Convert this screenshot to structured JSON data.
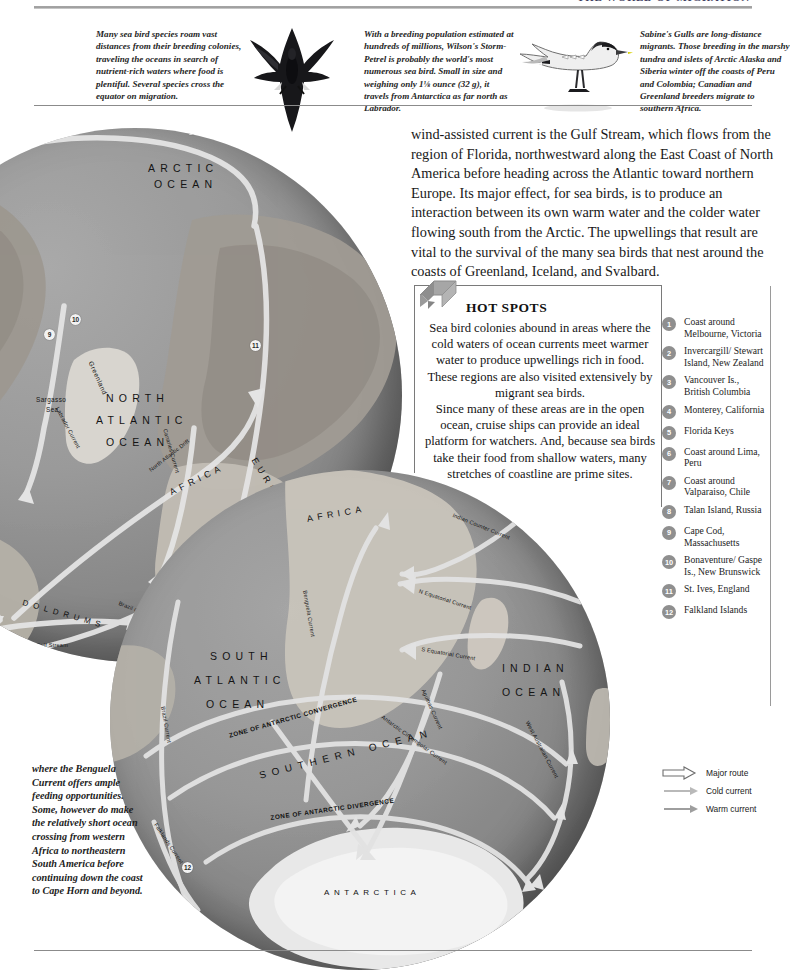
{
  "header": {
    "title": "THE WORLD OF MIGRATION"
  },
  "captions": [
    {
      "id": "cap-1",
      "text": "Many sea bird species roam vast distances from their breeding colonies, traveling the oceans in search of nutrient-rich waters where food is plentiful. Several species cross the equator on migration."
    },
    {
      "id": "cap-2",
      "text": "With a breeding population estimated at hundreds of millions, Wilson's Storm-Petrel is probably the world's most numerous sea bird. Small in size and weighing only 1⅛ ounce (32 g), it travels from Antarctica as far north as Labrador."
    },
    {
      "id": "cap-3",
      "text": "Sabine's Gulls are long-distance migrants. Those breeding in the marshy tundra and islets of Arctic Alaska and Siberia winter off the coasts of Peru and Colombia; Canadian and Greenland breeders migrate to southern Africa."
    }
  ],
  "birds": [
    {
      "name": "wilsons-storm-petrel",
      "label": "Wilson's Storm-Petrel"
    },
    {
      "name": "sabines-gull",
      "label": "Sabine's Gull"
    }
  ],
  "body_copy": "wind-assisted current is the Gulf Stream, which flows from the region of Florida, northwestward along the East Coast of North America before heading across the Atlantic toward northern Europe. Its major effect, for sea birds, is to produce an interaction between its own warm water and the colder water flowing south from the Arctic. The upwellings that result are vital to the survival of the many sea birds that nest around the coasts of Greenland, Iceland, and Svalbard.",
  "hotspots_box": {
    "title": "HOT SPOTS",
    "paragraph_1": "Sea bird colonies abound in areas where the cold waters of ocean currents meet warmer water to produce upwellings rich in food. These regions are also visited extensively by migrant sea birds.",
    "paragraph_2": "Since many of these areas are in the open ocean, cruise ships can provide an ideal platform for watchers. And, because sea birds take their food from shallow waters, many stretches of coastline are prime sites."
  },
  "hotspot_list": [
    {
      "num": "1",
      "label": "Coast around Melbourne, Victoria"
    },
    {
      "num": "2",
      "label": "Invercargill/ Stewart Island, New Zealand"
    },
    {
      "num": "3",
      "label": "Vancouver Is., British Columbia"
    },
    {
      "num": "4",
      "label": "Monterey, California"
    },
    {
      "num": "5",
      "label": "Florida Keys"
    },
    {
      "num": "6",
      "label": "Coast around Lima, Peru"
    },
    {
      "num": "7",
      "label": "Coast around Valparaiso, Chile"
    },
    {
      "num": "8",
      "label": "Talan Island, Russia"
    },
    {
      "num": "9",
      "label": "Cape Cod, Massachusetts"
    },
    {
      "num": "10",
      "label": "Bonaventure/ Gaspe Is., New Brunswick"
    },
    {
      "num": "11",
      "label": "St. Ives, England"
    },
    {
      "num": "12",
      "label": "Falkland Islands"
    }
  ],
  "legend": [
    {
      "symbol": "major-route-arrow",
      "label": "Major route"
    },
    {
      "symbol": "cold-current-arrow",
      "label": "Cold current"
    },
    {
      "symbol": "warm-current-arrow",
      "label": "Warm current"
    }
  ],
  "bottom_caption": "where the Benguela Current offers ample feeding opportunities. Some, however do make the relatively short ocean crossing from western Africa to northeastern South America before continuing down the coast to Cape Horn and beyond.",
  "globe_north": {
    "oceans": [
      "ARCTIC OCEAN",
      "NORTH ATLANTIC OCEAN"
    ],
    "continents": [
      "NORTH AMERICA",
      "ASIA",
      "EUROPE",
      "AFRICA",
      "SOUTH AMERICA"
    ],
    "places": [
      "Greenland",
      "Sargasso Sea"
    ],
    "zones": [
      "DOLDRUMS"
    ],
    "currents": [
      "Labrador Current",
      "North Atlantic Drift",
      "Gulf Stream",
      "North Equatorial Current",
      "Canaries Current",
      "Brazil Current"
    ],
    "markers": [
      "9",
      "10",
      "11"
    ]
  },
  "globe_south": {
    "oceans": [
      "SOUTH ATLANTIC OCEAN",
      "INDIAN OCEAN",
      "SOUTHERN OCEAN"
    ],
    "continents": [
      "AFRICA"
    ],
    "places": [
      "ANTARCTICA"
    ],
    "zones": [
      "ZONE OF ANTARCTIC CONVERGENCE",
      "ZONE OF ANTARCTIC DIVERGENCE"
    ],
    "currents": [
      "Benguela Current",
      "Brazil Current",
      "Agulhas Current",
      "Indian Counter Current",
      "N Equatorial Current",
      "S Equatorial Current",
      "Antarctic Circumpolar Current",
      "West Australian Current",
      "Falklands Current"
    ],
    "markers": [
      "12"
    ]
  },
  "colors": {
    "page_bg": "#ffffff",
    "rule": "#8b8b8b",
    "ocean": "#8f8f8f",
    "land": "#b9b4ac",
    "ice": "#e9e9e9",
    "current_arrow": "#e3e3e3",
    "marker_fill": "#8f8f8f",
    "text": "#1a1a1a"
  }
}
